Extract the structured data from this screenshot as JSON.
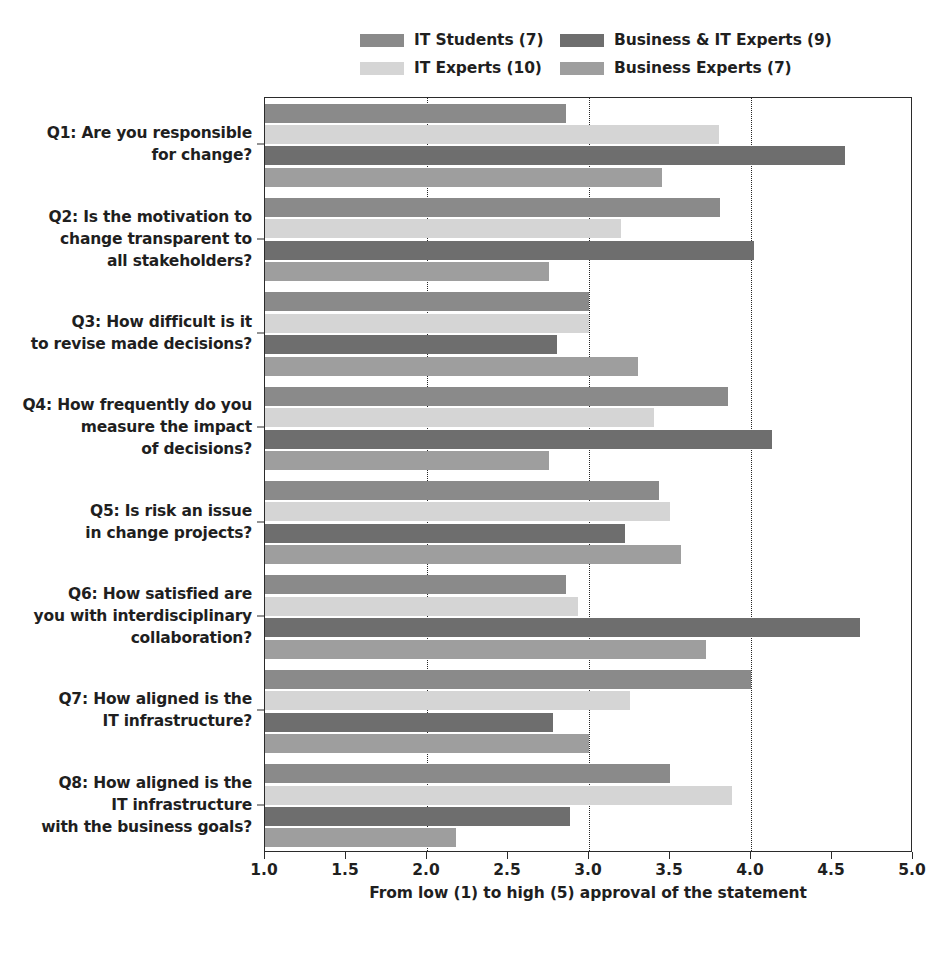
{
  "chart_data": {
    "type": "bar",
    "orientation": "horizontal",
    "title": "",
    "xlabel": "From low (1) to high (5) approval of the statement",
    "ylabel": "",
    "xlim": [
      1.0,
      5.0
    ],
    "xticks": [
      "1.0",
      "1.5",
      "2.0",
      "2.5",
      "3.0",
      "3.5",
      "4.0",
      "4.5",
      "5.0"
    ],
    "xtick_values": [
      1.0,
      1.5,
      2.0,
      2.5,
      3.0,
      3.5,
      4.0,
      4.5,
      5.0
    ],
    "gridlines": [
      2.0,
      3.0,
      4.0
    ],
    "grid": true,
    "legend_position": "top",
    "categories": [
      "Q1: Are you responsible\nfor change?",
      "Q2: Is the motivation to\nchange transparent to\nall stakeholders?",
      "Q3: How difficult is it\nto revise made decisions?",
      "Q4: How frequently do you\nmeasure the impact\nof decisions?",
      "Q5: Is risk an issue\nin change projects?",
      "Q6: How satisfied are\nyou with interdisciplinary\ncollaboration?",
      "Q7: How aligned is the\nIT infrastructure?",
      "Q8: How aligned is the\nIT infrastructure\nwith the business goals?"
    ],
    "series": [
      {
        "name": "IT Students (7)",
        "color": "#8a8a8a",
        "values": [
          2.86,
          3.81,
          3.0,
          3.86,
          3.43,
          2.86,
          4.0,
          3.5
        ]
      },
      {
        "name": "IT Experts (10)",
        "color": "#d5d5d5",
        "values": [
          3.8,
          3.2,
          3.0,
          3.4,
          3.5,
          2.93,
          3.25,
          3.88
        ]
      },
      {
        "name": "Business & IT Experts (9)",
        "color": "#6e6e6e",
        "values": [
          4.58,
          4.02,
          2.8,
          4.13,
          3.22,
          4.67,
          2.78,
          2.88
        ]
      },
      {
        "name": "Business Experts (7)",
        "color": "#9e9e9e",
        "values": [
          3.45,
          2.75,
          3.3,
          2.75,
          3.57,
          3.72,
          3.0,
          2.18
        ]
      }
    ]
  },
  "legend": {
    "entries": [
      {
        "label": "IT Students (7)",
        "color": "#8a8a8a"
      },
      {
        "label": "Business & IT Experts (9)",
        "color": "#6e6e6e"
      },
      {
        "label": "IT Experts (10)",
        "color": "#d5d5d5"
      },
      {
        "label": "Business Experts (7)",
        "color": "#9e9e9e"
      }
    ]
  }
}
